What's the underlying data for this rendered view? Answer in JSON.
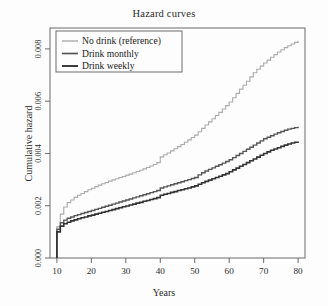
{
  "chart_data": {
    "type": "line",
    "title": "Hazard curves",
    "xlabel": "Years",
    "ylabel": "Cumulative hazard",
    "xlim": [
      8,
      82
    ],
    "ylim": [
      0,
      0.0088
    ],
    "xticks": [
      10,
      20,
      30,
      40,
      50,
      60,
      70,
      80
    ],
    "xtick_labels": [
      "10",
      "20",
      "30",
      "40",
      "50",
      "60",
      "70",
      "80"
    ],
    "yticks": [
      0,
      0.002,
      0.004,
      0.006,
      0.008
    ],
    "ytick_labels": [
      "0.000",
      "0.002",
      "0.004",
      "0.006",
      "0.008"
    ],
    "grid": false,
    "step": true,
    "legend_position": "top-left",
    "series": [
      {
        "name": "No drink (reference)",
        "color": "#aaaaaa",
        "width": 1.1,
        "x": [
          10,
          10,
          11,
          12,
          13,
          14,
          15,
          16,
          17,
          18,
          19,
          20,
          21,
          22,
          23,
          24,
          25,
          26,
          27,
          28,
          29,
          30,
          31,
          32,
          33,
          34,
          35,
          36,
          37,
          38,
          39,
          40,
          41,
          42,
          43,
          44,
          45,
          46,
          47,
          48,
          49,
          50,
          51,
          52,
          53,
          54,
          55,
          56,
          57,
          58,
          59,
          60,
          61,
          62,
          63,
          64,
          65,
          66,
          67,
          68,
          69,
          70,
          71,
          72,
          73,
          74,
          75,
          76,
          77,
          78,
          79,
          80
        ],
        "y": [
          0.0,
          0.0012,
          0.00168,
          0.00195,
          0.00212,
          0.00222,
          0.00232,
          0.0024,
          0.00247,
          0.00254,
          0.00261,
          0.00267,
          0.00273,
          0.00279,
          0.00284,
          0.00289,
          0.00294,
          0.00299,
          0.00303,
          0.00308,
          0.00312,
          0.00317,
          0.00321,
          0.00326,
          0.00331,
          0.00336,
          0.00341,
          0.00346,
          0.00352,
          0.00358,
          0.00365,
          0.00387,
          0.00395,
          0.00402,
          0.0041,
          0.00418,
          0.00426,
          0.00434,
          0.00443,
          0.00452,
          0.00461,
          0.0047,
          0.00483,
          0.00496,
          0.00509,
          0.00521,
          0.00533,
          0.00545,
          0.00557,
          0.0057,
          0.00583,
          0.00597,
          0.00613,
          0.0063,
          0.00646,
          0.00661,
          0.00676,
          0.00693,
          0.00709,
          0.00722,
          0.00734,
          0.00746,
          0.00757,
          0.00768,
          0.00778,
          0.00788,
          0.00797,
          0.00805,
          0.00812,
          0.00819,
          0.00825,
          0.00831
        ]
      },
      {
        "name": "Drink monthly",
        "color": "#555555",
        "width": 1.4,
        "x": [
          10,
          10,
          11,
          12,
          13,
          14,
          15,
          16,
          17,
          18,
          19,
          20,
          21,
          22,
          23,
          24,
          25,
          26,
          27,
          28,
          29,
          30,
          31,
          32,
          33,
          34,
          35,
          36,
          37,
          38,
          39,
          40,
          41,
          42,
          43,
          44,
          45,
          46,
          47,
          48,
          49,
          50,
          51,
          52,
          53,
          54,
          55,
          56,
          57,
          58,
          59,
          60,
          61,
          62,
          63,
          64,
          65,
          66,
          67,
          68,
          69,
          70,
          71,
          72,
          73,
          74,
          75,
          76,
          77,
          78,
          79,
          80
        ],
        "y": [
          0.0,
          0.0011,
          0.00135,
          0.00145,
          0.00152,
          0.00157,
          0.00162,
          0.00166,
          0.0017,
          0.00174,
          0.00178,
          0.00182,
          0.00186,
          0.0019,
          0.00194,
          0.00198,
          0.00202,
          0.00206,
          0.0021,
          0.00214,
          0.00218,
          0.00222,
          0.00226,
          0.0023,
          0.00234,
          0.00238,
          0.00242,
          0.00246,
          0.0025,
          0.00254,
          0.00258,
          0.00268,
          0.00272,
          0.00276,
          0.0028,
          0.00284,
          0.00288,
          0.00292,
          0.00296,
          0.003,
          0.00304,
          0.00308,
          0.00318,
          0.00326,
          0.00333,
          0.00339,
          0.00345,
          0.00351,
          0.00357,
          0.00363,
          0.00369,
          0.00376,
          0.00384,
          0.00392,
          0.004,
          0.00408,
          0.00416,
          0.00424,
          0.00432,
          0.0044,
          0.00448,
          0.00456,
          0.00462,
          0.00468,
          0.00474,
          0.00479,
          0.00484,
          0.00489,
          0.00493,
          0.00496,
          0.00499,
          0.00502
        ]
      },
      {
        "name": "Drink weekly",
        "color": "#333333",
        "width": 1.6,
        "x": [
          10,
          10,
          11,
          12,
          13,
          14,
          15,
          16,
          17,
          18,
          19,
          20,
          21,
          22,
          23,
          24,
          25,
          26,
          27,
          28,
          29,
          30,
          31,
          32,
          33,
          34,
          35,
          36,
          37,
          38,
          39,
          40,
          41,
          42,
          43,
          44,
          45,
          46,
          47,
          48,
          49,
          50,
          51,
          52,
          53,
          54,
          55,
          56,
          57,
          58,
          59,
          60,
          61,
          62,
          63,
          64,
          65,
          66,
          67,
          68,
          69,
          70,
          71,
          72,
          73,
          74,
          75,
          76,
          77,
          78,
          79,
          80
        ],
        "y": [
          0.0,
          0.001,
          0.00122,
          0.00131,
          0.00137,
          0.00142,
          0.00146,
          0.0015,
          0.00154,
          0.00157,
          0.00161,
          0.00164,
          0.00168,
          0.00171,
          0.00175,
          0.00178,
          0.00182,
          0.00185,
          0.00189,
          0.00192,
          0.00196,
          0.00199,
          0.00203,
          0.00206,
          0.0021,
          0.00213,
          0.00217,
          0.0022,
          0.00224,
          0.00227,
          0.00231,
          0.0024,
          0.00244,
          0.00247,
          0.00251,
          0.00254,
          0.00258,
          0.00261,
          0.00265,
          0.00268,
          0.00272,
          0.00276,
          0.00282,
          0.00288,
          0.00293,
          0.00298,
          0.00303,
          0.00308,
          0.00313,
          0.00318,
          0.00323,
          0.0033,
          0.00337,
          0.00344,
          0.00351,
          0.00358,
          0.00365,
          0.00372,
          0.00379,
          0.00386,
          0.00393,
          0.004,
          0.00406,
          0.00412,
          0.00417,
          0.00422,
          0.00427,
          0.00432,
          0.00436,
          0.0044,
          0.00443,
          0.00446
        ]
      }
    ]
  }
}
